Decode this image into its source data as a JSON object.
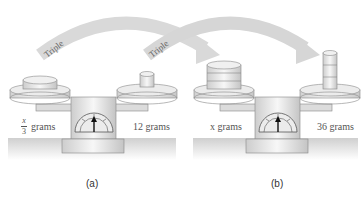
{
  "figure": {
    "panels": [
      {
        "id": "a",
        "caption": "(a)",
        "left_pan_label_numerator": "x",
        "left_pan_label_denominator": "3",
        "left_pan_label_unit": "grams",
        "right_pan_label": "12 grams"
      },
      {
        "id": "b",
        "caption": "(b)",
        "left_pan_label": "x grams",
        "right_pan_label": "36 grams"
      }
    ],
    "arrows": [
      {
        "label": "Triple",
        "from": "panel a left pan",
        "to": "panel b left pan"
      },
      {
        "label": "Triple",
        "from": "panel a right pan",
        "to": "panel b right pan"
      }
    ],
    "colors": {
      "arrow": "#d9d9d9",
      "scale_body": "#e6e6e6",
      "outline": "#777777",
      "ground": "#d4d4d4",
      "text": "#555555"
    }
  }
}
